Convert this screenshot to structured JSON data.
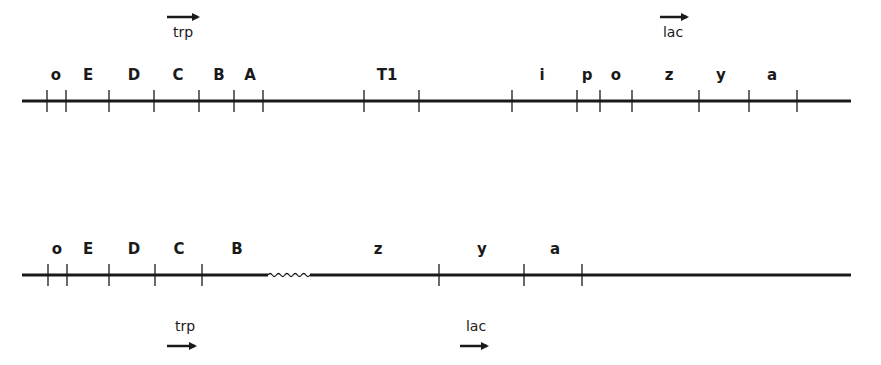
{
  "diagram": {
    "line_color": "#1a1a1a",
    "background": "#ffffff",
    "top_map": {
      "line": {
        "x1": 22,
        "x2": 851,
        "y": 101
      },
      "operon_labels": [
        {
          "label": "trp",
          "x": 183,
          "label_y": 37,
          "arrow_x1": 167,
          "arrow_x2": 204,
          "arrow_y": 17
        },
        {
          "label": "lac",
          "x": 673,
          "label_y": 37,
          "arrow_x1": 660,
          "arrow_x2": 693,
          "arrow_y": 17
        }
      ],
      "genes": [
        {
          "label": "o",
          "x": 56
        },
        {
          "label": "E",
          "x": 88
        },
        {
          "label": "D",
          "x": 134
        },
        {
          "label": "C",
          "x": 178
        },
        {
          "label": "B",
          "x": 219
        },
        {
          "label": "A",
          "x": 250
        },
        {
          "label": "T1",
          "x": 387
        },
        {
          "label": "i",
          "x": 542
        },
        {
          "label": "p",
          "x": 587
        },
        {
          "label": "o",
          "x": 616
        },
        {
          "label": "z",
          "x": 669
        },
        {
          "label": "y",
          "x": 721
        },
        {
          "label": "a",
          "x": 772
        }
      ],
      "ticks": [
        47,
        66,
        109,
        154,
        199,
        234,
        263,
        364,
        419,
        512,
        577,
        600,
        632,
        699,
        749,
        797
      ]
    },
    "bottom_map": {
      "line": {
        "x1": 22,
        "x2": 851,
        "y": 275
      },
      "wavy_segment": {
        "x1": 268,
        "x2": 310
      },
      "operon_labels": [
        {
          "label": "trp",
          "x": 185,
          "label_y": 331,
          "arrow_x1": 167,
          "arrow_x2": 201,
          "arrow_y": 346
        },
        {
          "label": "lac",
          "x": 476,
          "label_y": 331,
          "arrow_x1": 460,
          "arrow_x2": 493,
          "arrow_y": 346
        }
      ],
      "genes": [
        {
          "label": "o",
          "x": 57
        },
        {
          "label": "E",
          "x": 88
        },
        {
          "label": "D",
          "x": 134
        },
        {
          "label": "C",
          "x": 179
        },
        {
          "label": "B",
          "x": 237
        },
        {
          "label": "z",
          "x": 378
        },
        {
          "label": "y",
          "x": 482
        },
        {
          "label": "a",
          "x": 555
        }
      ],
      "ticks": [
        48,
        67,
        109,
        155,
        202,
        439,
        524,
        582
      ]
    }
  }
}
